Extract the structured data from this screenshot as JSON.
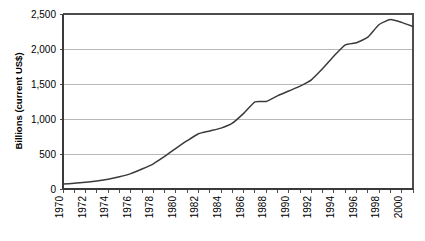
{
  "chart_data": {
    "type": "line",
    "title": "",
    "xlabel": "",
    "ylabel": "Billions (current US$)",
    "ylim": [
      0,
      2500
    ],
    "yticks": [
      0,
      500,
      1000,
      1500,
      2000,
      2500
    ],
    "ytick_labels": [
      "0",
      "500",
      "1,000",
      "1,500",
      "2,000",
      "2,500"
    ],
    "xlim": [
      1970,
      2001
    ],
    "xticks": [
      1970,
      1971,
      1972,
      1973,
      1974,
      1975,
      1976,
      1977,
      1978,
      1979,
      1980,
      1981,
      1982,
      1983,
      1984,
      1985,
      1986,
      1987,
      1988,
      1989,
      1990,
      1991,
      1992,
      1993,
      1994,
      1995,
      1996,
      1997,
      1998,
      1999,
      2000,
      2001
    ],
    "xtick_labels": [
      "1970",
      "",
      "1972",
      "",
      "1974",
      "",
      "1976",
      "",
      "1978",
      "",
      "1980",
      "",
      "1982",
      "",
      "1984",
      "",
      "1986",
      "",
      "1988",
      "",
      "1990",
      "",
      "1992",
      "",
      "1994",
      "",
      "1996",
      "",
      "1998",
      "",
      "2000",
      ""
    ],
    "grid": true,
    "legend": false,
    "series": [
      {
        "name": "Billions (current US$)",
        "x": [
          1970,
          1971,
          1972,
          1973,
          1974,
          1975,
          1976,
          1977,
          1978,
          1979,
          1980,
          1981,
          1982,
          1983,
          1984,
          1985,
          1986,
          1987,
          1988,
          1989,
          1990,
          1991,
          1992,
          1993,
          1994,
          1995,
          1996,
          1997,
          1998,
          1999,
          2000,
          2001
        ],
        "values": [
          70,
          82,
          95,
          115,
          140,
          175,
          220,
          285,
          360,
          465,
          580,
          690,
          790,
          830,
          870,
          940,
          1080,
          1245,
          1250,
          1330,
          1400,
          1470,
          1560,
          1720,
          1900,
          2060,
          2090,
          2170,
          2350,
          2420,
          2380,
          2320
        ]
      }
    ],
    "colors": {
      "line": "#3b3b3b",
      "grid": "#a6a6a6",
      "frame": "#4d4d4d",
      "text": "#000000",
      "background": "#ffffff"
    }
  },
  "axis_label": {
    "y": "Billions (current US$)"
  }
}
